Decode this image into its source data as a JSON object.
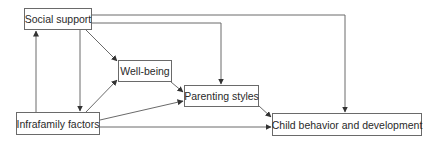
{
  "diagram": {
    "type": "path model",
    "nodes": [
      {
        "id": "social",
        "label": "Social support"
      },
      {
        "id": "wellbeing",
        "label": "Well-being"
      },
      {
        "id": "parenting",
        "label": "Parenting styles"
      },
      {
        "id": "infrafamily",
        "label": "Infrafamily factors"
      },
      {
        "id": "child",
        "label": "Child behavior and development"
      }
    ],
    "edges": [
      {
        "from": "social",
        "to": "wellbeing"
      },
      {
        "from": "social",
        "to": "parenting"
      },
      {
        "from": "social",
        "to": "child"
      },
      {
        "from": "social",
        "to": "infrafamily"
      },
      {
        "from": "infrafamily",
        "to": "social"
      },
      {
        "from": "infrafamily",
        "to": "wellbeing"
      },
      {
        "from": "infrafamily",
        "to": "parenting"
      },
      {
        "from": "infrafamily",
        "to": "child"
      },
      {
        "from": "wellbeing",
        "to": "parenting"
      },
      {
        "from": "parenting",
        "to": "child"
      }
    ],
    "colors": {
      "line": "#6a6a6a",
      "text": "#2a2a2a",
      "background": "#ffffff"
    }
  }
}
